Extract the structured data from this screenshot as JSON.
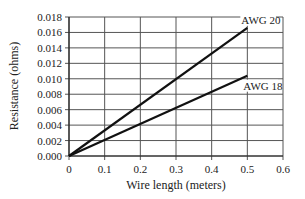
{
  "chart_data": {
    "type": "line",
    "title": "",
    "xlabel": "Wire length (meters)",
    "ylabel": "Resistance (ohms)",
    "xlim": [
      0,
      0.6
    ],
    "ylim": [
      0,
      0.018
    ],
    "x_ticks": [
      "0",
      "0.1",
      "0.2",
      "0.3",
      "0.4",
      "0.5",
      "0.6"
    ],
    "y_ticks": [
      "0.000",
      "0.002",
      "0.004",
      "0.006",
      "0.008",
      "0.010",
      "0.012",
      "0.014",
      "0.016",
      "0.018"
    ],
    "grid": true,
    "legend": "inline labels at line ends",
    "series": [
      {
        "name": "AWG 20",
        "x": [
          0,
          0.5
        ],
        "y": [
          0,
          0.0166
        ],
        "label": "AWG 20",
        "color": "#111111"
      },
      {
        "name": "AWG 18",
        "x": [
          0,
          0.5
        ],
        "y": [
          0,
          0.0104
        ],
        "label": "AWG 18",
        "color": "#111111"
      }
    ]
  }
}
